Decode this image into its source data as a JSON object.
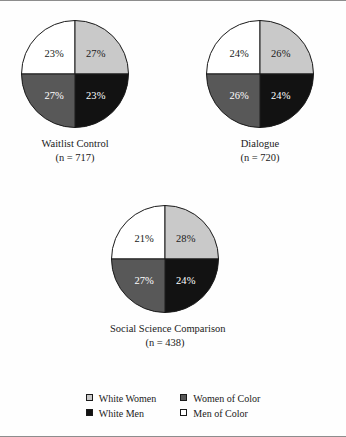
{
  "chart_data": {
    "type": "pie",
    "title": "",
    "legend_position": "bottom",
    "categories": [
      "White Women",
      "Women of Color",
      "White Men",
      "Men of Color"
    ],
    "colors": {
      "white_women": "#c9c9c9",
      "women_of_color": "#585858",
      "white_men": "#121212",
      "men_of_color": "#ffffff",
      "outline": "#1a1a1a",
      "frame_rule": "#8d8d8d"
    },
    "charts": [
      {
        "id": "waitlist-control",
        "title": "Waitlist Control",
        "n_label": "(n = 717)",
        "n": 717,
        "slices": [
          {
            "category": "Men of Color",
            "value": 23,
            "label": "23%",
            "fill": "#ffffff",
            "label_color": "dark",
            "start": 270,
            "end": 360
          },
          {
            "category": "White Women",
            "value": 27,
            "label": "27%",
            "fill": "#c9c9c9",
            "label_color": "dark",
            "start": 0,
            "end": 90
          },
          {
            "category": "White Men",
            "value": 23,
            "label": "23%",
            "fill": "#121212",
            "label_color": "light",
            "start": 90,
            "end": 180
          },
          {
            "category": "Women of Color",
            "value": 27,
            "label": "27%",
            "fill": "#585858",
            "label_color": "light",
            "start": 180,
            "end": 270
          }
        ]
      },
      {
        "id": "dialogue",
        "title": "Dialogue",
        "n_label": "(n = 720)",
        "n": 720,
        "slices": [
          {
            "category": "Men of Color",
            "value": 24,
            "label": "24%",
            "fill": "#ffffff",
            "label_color": "dark",
            "start": 270,
            "end": 360
          },
          {
            "category": "White Women",
            "value": 26,
            "label": "26%",
            "fill": "#c9c9c9",
            "label_color": "dark",
            "start": 0,
            "end": 90
          },
          {
            "category": "White Men",
            "value": 24,
            "label": "24%",
            "fill": "#121212",
            "label_color": "light",
            "start": 90,
            "end": 180
          },
          {
            "category": "Women of Color",
            "value": 26,
            "label": "26%",
            "fill": "#585858",
            "label_color": "light",
            "start": 180,
            "end": 270
          }
        ]
      },
      {
        "id": "social-science-comparison",
        "title": "Social Science Comparison",
        "n_label": "(n = 438)",
        "n": 438,
        "slices": [
          {
            "category": "Men of Color",
            "value": 21,
            "label": "21%",
            "fill": "#ffffff",
            "label_color": "dark",
            "start": 270,
            "end": 360
          },
          {
            "category": "White Women",
            "value": 28,
            "label": "28%",
            "fill": "#c9c9c9",
            "label_color": "dark",
            "start": 0,
            "end": 90
          },
          {
            "category": "White Men",
            "value": 24,
            "label": "24%",
            "fill": "#121212",
            "label_color": "light",
            "start": 90,
            "end": 180
          },
          {
            "category": "Women of Color",
            "value": 27,
            "label": "27%",
            "fill": "#585858",
            "label_color": "light",
            "start": 180,
            "end": 270
          }
        ]
      }
    ]
  },
  "legend": {
    "items": [
      {
        "label": "White Women",
        "swatch": "#c9c9c9"
      },
      {
        "label": "Women of Color",
        "swatch": "#585858"
      },
      {
        "label": "White Men",
        "swatch": "#121212"
      },
      {
        "label": "Men of Color",
        "swatch": "#ffffff"
      }
    ]
  }
}
